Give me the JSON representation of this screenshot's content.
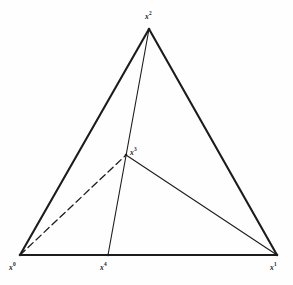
{
  "figure": {
    "type": "geometric-diagram",
    "canvas": {
      "width": 293,
      "height": 285
    },
    "background_color": "#fefefe",
    "line_color": "#1c1c1c",
    "vertices": [
      {
        "id": "x0",
        "base": "x",
        "superscript": "0",
        "label": "x⁰",
        "x": 20,
        "y": 255,
        "label_x": 9,
        "label_y": 262
      },
      {
        "id": "x1",
        "base": "x",
        "superscript": "1",
        "label": "x¹",
        "x": 277,
        "y": 255,
        "label_x": 270,
        "label_y": 262
      },
      {
        "id": "x2",
        "base": "x",
        "superscript": "2",
        "label": "x²",
        "x": 149,
        "y": 29,
        "label_x": 145,
        "label_y": 11
      },
      {
        "id": "x3",
        "base": "x",
        "superscript": "3",
        "label": "x³",
        "x": 126,
        "y": 155,
        "label_x": 130,
        "label_y": 147
      },
      {
        "id": "x4",
        "base": "x",
        "superscript": "4",
        "label": "x⁴",
        "x": 108,
        "y": 255,
        "label_x": 100,
        "label_y": 262
      }
    ],
    "edges": [
      {
        "name": "edge-x0-x1-base",
        "from": "x0",
        "to": "x1",
        "style": "solid",
        "weight": 2.1
      },
      {
        "name": "edge-x0-x2-left",
        "from": "x0",
        "to": "x2",
        "style": "solid",
        "weight": 2.1
      },
      {
        "name": "edge-x2-x1-right",
        "from": "x2",
        "to": "x1",
        "style": "solid",
        "weight": 2.1
      },
      {
        "name": "edge-x2-x4-median",
        "from": "x2",
        "to": "x4",
        "style": "solid",
        "weight": 1.1
      },
      {
        "name": "edge-x3-x1-inner",
        "from": "x3",
        "to": "x1",
        "style": "solid",
        "weight": 1.1
      },
      {
        "name": "edge-x0-x3-hidden",
        "from": "x0",
        "to": "x3",
        "style": "dashed",
        "weight": 1.3,
        "dash_pattern": "7,4"
      }
    ]
  }
}
